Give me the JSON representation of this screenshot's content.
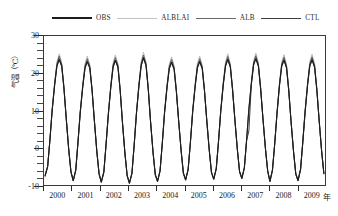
{
  "chart_data": {
    "type": "line",
    "title": "",
    "subtitle": "",
    "xlabel": "年",
    "ylabel": "气温（℃）",
    "xlim": [
      2000,
      2010
    ],
    "ylim": [
      -10,
      30
    ],
    "y_ticks": [
      30,
      20,
      10,
      0,
      -10
    ],
    "y_minor_interval": 2,
    "x_ticks": [
      2000,
      2001,
      2002,
      2003,
      2004,
      2005,
      2006,
      2007,
      2008,
      2009
    ],
    "x_tick_labels": [
      "2000",
      "2001",
      "2002",
      "2003",
      "2004",
      "2005",
      "2006",
      "2007",
      "2008",
      "2009"
    ],
    "grid": false,
    "legend_position": "top",
    "x": [
      2000.04,
      2000.13,
      2000.21,
      2000.29,
      2000.38,
      2000.46,
      2000.54,
      2000.63,
      2000.71,
      2000.79,
      2000.88,
      2000.96,
      2001.04,
      2001.13,
      2001.21,
      2001.29,
      2001.38,
      2001.46,
      2001.54,
      2001.63,
      2001.71,
      2001.79,
      2001.88,
      2001.96,
      2002.04,
      2002.13,
      2002.21,
      2002.29,
      2002.38,
      2002.46,
      2002.54,
      2002.63,
      2002.71,
      2002.79,
      2002.88,
      2002.96,
      2003.04,
      2003.13,
      2003.21,
      2003.29,
      2003.38,
      2003.46,
      2003.54,
      2003.63,
      2003.71,
      2003.79,
      2003.88,
      2003.96,
      2004.04,
      2004.13,
      2004.21,
      2004.29,
      2004.38,
      2004.46,
      2004.54,
      2004.63,
      2004.71,
      2004.79,
      2004.88,
      2004.96,
      2005.04,
      2005.13,
      2005.21,
      2005.29,
      2005.38,
      2005.46,
      2005.54,
      2005.63,
      2005.71,
      2005.79,
      2005.88,
      2005.96,
      2006.04,
      2006.13,
      2006.21,
      2006.29,
      2006.38,
      2006.46,
      2006.54,
      2006.63,
      2006.71,
      2006.79,
      2006.88,
      2006.96,
      2007.04,
      2007.13,
      2007.21,
      2007.29,
      2007.38,
      2007.46,
      2007.54,
      2007.63,
      2007.71,
      2007.79,
      2007.88,
      2007.96,
      2008.04,
      2008.13,
      2008.21,
      2008.29,
      2008.38,
      2008.46,
      2008.54,
      2008.63,
      2008.71,
      2008.79,
      2008.88,
      2008.96,
      2009.04,
      2009.13,
      2009.21,
      2009.29,
      2009.38,
      2009.46,
      2009.54,
      2009.63,
      2009.71,
      2009.79,
      2009.88,
      2009.96
    ],
    "series": [
      {
        "name": "OBS",
        "color": "#1c1c1c",
        "width": 1.1,
        "values": [
          -7.5,
          -5.0,
          2.0,
          10.0,
          17.0,
          22.0,
          23.8,
          22.0,
          16.0,
          8.0,
          -0.5,
          -6.5,
          -8.8,
          -6.0,
          1.5,
          9.5,
          16.5,
          21.5,
          23.2,
          21.5,
          15.5,
          7.5,
          -1.0,
          -7.0,
          -9.2,
          -6.5,
          1.0,
          9.0,
          16.5,
          21.8,
          23.5,
          21.8,
          15.5,
          7.0,
          -1.5,
          -7.5,
          -9.5,
          -6.8,
          0.8,
          9.2,
          16.8,
          22.2,
          24.2,
          22.2,
          15.8,
          7.2,
          -1.2,
          -7.2,
          -9.0,
          -6.2,
          1.2,
          9.4,
          16.4,
          21.4,
          23.0,
          21.2,
          15.2,
          7.4,
          -0.8,
          -6.8,
          -8.6,
          -5.8,
          1.4,
          9.6,
          16.6,
          21.6,
          23.2,
          21.4,
          15.4,
          7.6,
          -0.6,
          -6.6,
          -8.4,
          -5.6,
          1.6,
          9.8,
          17.0,
          22.0,
          23.8,
          21.8,
          15.6,
          7.8,
          -0.4,
          -6.4,
          -8.2,
          -5.4,
          2.0,
          10.2,
          17.2,
          22.4,
          24.0,
          22.0,
          15.8,
          8.0,
          -0.2,
          -6.2,
          -9.0,
          -6.0,
          1.0,
          9.0,
          16.8,
          22.0,
          23.6,
          21.6,
          15.4,
          7.2,
          -1.0,
          -7.0,
          -8.8,
          -5.8,
          1.5,
          9.5,
          16.9,
          22.1,
          23.7,
          21.7,
          15.5,
          7.5,
          -0.9,
          -6.9
        ]
      },
      {
        "name": "ALBLAI",
        "color": "#b9b9b9",
        "width": 1.0,
        "values": [
          -7.8,
          -5.2,
          2.2,
          10.4,
          17.6,
          23.0,
          25.2,
          22.8,
          16.4,
          8.2,
          -0.6,
          -6.8,
          -9.0,
          -6.2,
          1.7,
          9.9,
          17.1,
          22.5,
          24.6,
          22.3,
          15.9,
          7.7,
          -1.1,
          -7.2,
          -9.4,
          -6.7,
          1.2,
          9.4,
          17.1,
          22.8,
          24.9,
          22.6,
          15.9,
          7.2,
          -1.6,
          -7.7,
          -9.7,
          -7.0,
          1.0,
          9.6,
          17.4,
          23.2,
          25.6,
          23.0,
          16.2,
          7.4,
          -1.3,
          -7.4,
          -9.2,
          -6.4,
          1.4,
          9.8,
          17.0,
          22.4,
          24.4,
          22.0,
          15.6,
          7.6,
          -0.9,
          -7.0,
          -8.8,
          -6.0,
          1.6,
          10.0,
          17.2,
          22.6,
          24.6,
          22.2,
          15.8,
          7.8,
          -0.7,
          -6.8,
          -8.6,
          -5.8,
          1.8,
          10.2,
          17.6,
          23.0,
          25.2,
          22.6,
          16.0,
          8.0,
          -0.5,
          -6.6,
          -8.4,
          -5.6,
          2.2,
          10.6,
          17.8,
          23.4,
          25.4,
          22.8,
          16.2,
          8.2,
          -0.3,
          -6.4,
          -9.2,
          -6.2,
          1.2,
          9.4,
          17.4,
          23.0,
          25.0,
          22.4,
          15.8,
          7.4,
          -1.1,
          -7.2,
          -9.0,
          -6.0,
          1.7,
          9.9,
          17.5,
          23.1,
          25.1,
          22.5,
          15.9,
          7.7,
          -1.0,
          -7.1
        ]
      },
      {
        "name": "ALB",
        "color": "#5e5e5e",
        "width": 1.0,
        "values": [
          -7.6,
          -5.1,
          2.1,
          10.2,
          17.3,
          22.6,
          24.6,
          22.4,
          16.2,
          8.1,
          -0.5,
          -6.6,
          -8.9,
          -6.1,
          1.6,
          9.7,
          16.8,
          22.0,
          23.9,
          21.9,
          15.7,
          7.6,
          -1.0,
          -7.1,
          -9.3,
          -6.6,
          1.1,
          9.2,
          16.8,
          22.3,
          24.2,
          22.2,
          15.7,
          7.1,
          -1.5,
          -7.6,
          -9.6,
          -6.9,
          0.9,
          9.4,
          17.1,
          22.7,
          24.9,
          22.6,
          16.0,
          7.3,
          -1.2,
          -7.3,
          -9.1,
          -6.3,
          1.3,
          9.6,
          16.7,
          21.9,
          23.7,
          21.6,
          15.4,
          7.5,
          -0.8,
          -6.9,
          -8.7,
          -5.9,
          1.5,
          9.8,
          16.9,
          22.1,
          23.9,
          21.8,
          15.6,
          7.7,
          -0.6,
          -6.7,
          -8.5,
          -5.7,
          1.7,
          10.0,
          17.3,
          22.5,
          24.5,
          22.2,
          15.8,
          7.9,
          -0.4,
          -6.5,
          -8.3,
          -5.5,
          2.1,
          10.4,
          17.5,
          22.9,
          24.7,
          22.4,
          16.0,
          8.1,
          -0.2,
          -6.3,
          -9.1,
          -6.1,
          1.1,
          9.2,
          17.1,
          22.5,
          24.3,
          22.0,
          15.6,
          7.3,
          -1.0,
          -7.1,
          -8.9,
          -5.9,
          1.6,
          9.7,
          17.2,
          22.6,
          24.4,
          22.1,
          15.7,
          7.6,
          -0.9,
          -7.0
        ]
      },
      {
        "name": "CTL",
        "color": "#3d3d3d",
        "width": 1.0,
        "values": [
          -7.4,
          -4.9,
          1.9,
          9.9,
          16.8,
          21.8,
          23.6,
          21.8,
          15.9,
          7.9,
          -0.4,
          -6.4,
          -8.7,
          -5.9,
          1.4,
          9.4,
          16.3,
          21.3,
          23.0,
          21.3,
          15.4,
          7.4,
          -0.9,
          -6.9,
          -9.1,
          -6.4,
          0.9,
          8.9,
          16.3,
          21.6,
          23.3,
          21.6,
          15.4,
          6.9,
          -1.4,
          -7.4,
          -9.4,
          -6.7,
          0.7,
          9.1,
          16.6,
          22.0,
          24.0,
          22.0,
          15.7,
          7.1,
          -1.1,
          -7.1,
          -8.9,
          -6.1,
          1.1,
          9.3,
          16.2,
          21.2,
          22.8,
          21.0,
          15.1,
          7.3,
          -0.7,
          -6.7,
          -8.5,
          -5.7,
          1.3,
          9.5,
          16.4,
          21.4,
          23.0,
          21.2,
          15.3,
          7.5,
          -0.5,
          -6.5,
          -8.3,
          -5.5,
          1.5,
          9.7,
          16.8,
          21.8,
          23.6,
          21.6,
          15.5,
          7.7,
          -0.3,
          -6.3,
          -8.1,
          -5.3,
          1.9,
          4.5,
          17.0,
          22.2,
          23.8,
          21.8,
          15.7,
          7.9,
          -0.1,
          -6.1,
          -8.9,
          -5.9,
          0.9,
          8.9,
          16.6,
          21.8,
          23.4,
          21.4,
          15.3,
          7.1,
          -0.9,
          -6.9,
          -8.7,
          -5.7,
          1.4,
          9.4,
          16.7,
          21.9,
          23.5,
          21.5,
          15.4,
          7.4,
          -0.8,
          -6.8
        ]
      }
    ],
    "legend": [
      {
        "label": "OBS",
        "color": "#1c1c1c",
        "width": 2.1
      },
      {
        "label": "ALBLAI",
        "color": "#c2c2c2",
        "width": 1.5
      },
      {
        "label": "ALB",
        "color": "#6a6a6a",
        "width": 1.7
      },
      {
        "label": "CTL",
        "color": "#3d3d3d",
        "width": 1.7
      }
    ]
  }
}
